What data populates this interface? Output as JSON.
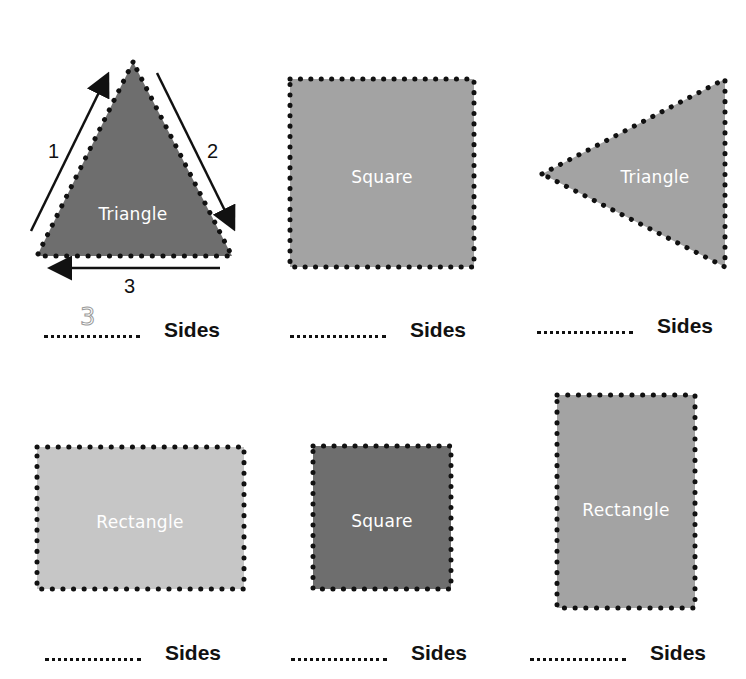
{
  "worksheet": {
    "colors": {
      "dark": "#6e6e6e",
      "medium": "#a3a3a3",
      "light": "#c6c6c6",
      "dots": "#111111"
    },
    "shapes": [
      {
        "label": "Triangle",
        "fill": "dark",
        "answer": "3",
        "side_numbers": [
          "1",
          "2",
          "3"
        ]
      },
      {
        "label": "Square",
        "fill": "medium",
        "answer": ""
      },
      {
        "label": "Triangle",
        "fill": "medium",
        "answer": ""
      },
      {
        "label": "Rectangle",
        "fill": "light",
        "answer": ""
      },
      {
        "label": "Square",
        "fill": "dark",
        "answer": ""
      },
      {
        "label": "Rectangle",
        "fill": "medium",
        "answer": ""
      }
    ],
    "sides_label": "Sides"
  }
}
